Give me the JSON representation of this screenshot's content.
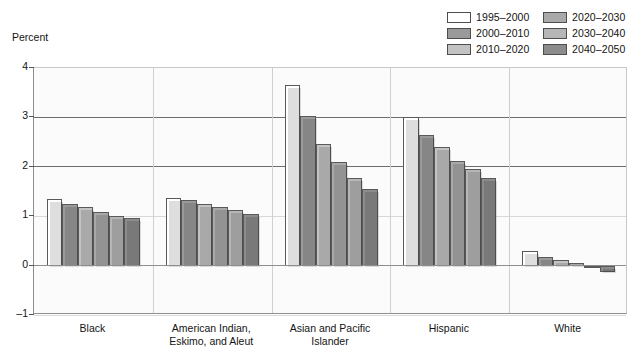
{
  "axis": {
    "y_title": "Percent",
    "y_ticks": [
      "4",
      "3",
      "2",
      "1",
      "0",
      "–1"
    ]
  },
  "legend": {
    "items": [
      {
        "label": "1995–2000",
        "color": "#ffffff"
      },
      {
        "label": "2000–2010",
        "color": "#9a9a9a"
      },
      {
        "label": "2010–2020",
        "color": "#c3c3c3"
      },
      {
        "label": "2020–2030",
        "color": "#a9a9a9"
      },
      {
        "label": "2030–2040",
        "color": "#b6b6b6"
      },
      {
        "label": "2040–2050",
        "color": "#8c8c8c"
      }
    ]
  },
  "chart_data": {
    "type": "bar",
    "title": "",
    "xlabel": "",
    "ylabel": "Percent",
    "ylim": [
      -1,
      4
    ],
    "yticks": [
      -1,
      0,
      1,
      2,
      3,
      4
    ],
    "grid": true,
    "legend_position": "top-right",
    "categories": [
      "Black",
      "American Indian, Eskimo, and Aleut",
      "Asian and Pacific Islander",
      "Hispanic",
      "White"
    ],
    "category_lines": [
      [
        "Black"
      ],
      [
        "American Indian,",
        "Eskimo, and Aleut"
      ],
      [
        "Asian and Pacific",
        "Islander"
      ],
      [
        "Hispanic"
      ],
      [
        "White"
      ]
    ],
    "series": [
      {
        "name": "1995–2000",
        "color": "#ffffff",
        "values": [
          1.35,
          1.37,
          3.65,
          3.0,
          0.3
        ]
      },
      {
        "name": "2000–2010",
        "color": "#9a9a9a",
        "values": [
          1.25,
          1.32,
          3.03,
          2.65,
          0.18
        ]
      },
      {
        "name": "2010–2020",
        "color": "#c3c3c3",
        "values": [
          1.18,
          1.25,
          2.47,
          2.4,
          0.12
        ]
      },
      {
        "name": "2020–2030",
        "color": "#a9a9a9",
        "values": [
          1.08,
          1.18,
          2.1,
          2.12,
          0.05
        ]
      },
      {
        "name": "2030–2040",
        "color": "#b6b6b6",
        "values": [
          1.0,
          1.12,
          1.78,
          1.95,
          -0.03
        ]
      },
      {
        "name": "2040–2050",
        "color": "#8c8c8c",
        "values": [
          0.97,
          1.05,
          1.55,
          1.78,
          -0.13
        ]
      }
    ]
  }
}
